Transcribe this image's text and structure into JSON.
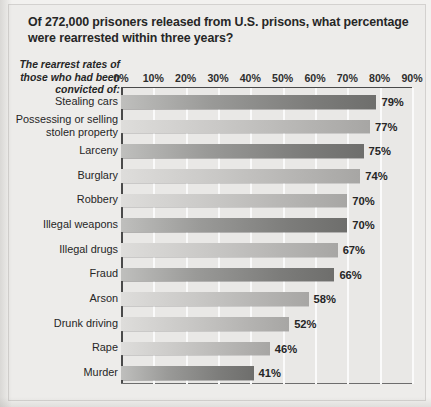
{
  "title": "Of 272,000 prisoners released from U.S. prisons, what percentage were rearrested within three years?",
  "axis_caption": "The rearrest rates of those who had been convicted of:",
  "colors": {
    "paper": "#edecea",
    "plot_background": "#e9e8e6",
    "gridline": "#fafafa",
    "axis": "#4a4a4a",
    "bar_dark": "#7c7c7a",
    "bar_light": "#b2b1af",
    "text": "#262626"
  },
  "chart_data": {
    "type": "bar",
    "orientation": "horizontal",
    "title": "Of 272,000 prisoners released from U.S. prisons, what percentage were rearrested within three years?",
    "xlabel": "",
    "ylabel": "The rearrest rates of those who had been convicted of:",
    "xlim": [
      0,
      90
    ],
    "xtick_labels": [
      "0%",
      "10%",
      "20%",
      "30%",
      "40%",
      "50%",
      "60%",
      "70%",
      "80%",
      "90%"
    ],
    "xticks": [
      0,
      10,
      20,
      30,
      40,
      50,
      60,
      70,
      80,
      90
    ],
    "grid": "vertical",
    "legend": "none",
    "value_suffix": "%",
    "categories": [
      "Stealing cars",
      "Possessing or selling stolen property",
      "Larceny",
      "Burglary",
      "Robbery",
      "Illegal weapons",
      "Illegal drugs",
      "Fraud",
      "Arson",
      "Drunk driving",
      "Rape",
      "Murder"
    ],
    "values": [
      79,
      77,
      75,
      74,
      70,
      70,
      67,
      66,
      58,
      52,
      46,
      41
    ],
    "data_labels": [
      "79%",
      "77%",
      "75%",
      "74%",
      "70%",
      "70%",
      "67%",
      "66%",
      "58%",
      "52%",
      "46%",
      "41%"
    ],
    "bar_shades": [
      "dark",
      "light",
      "dark",
      "light",
      "light",
      "dark",
      "light",
      "dark",
      "light",
      "light",
      "light",
      "dark"
    ],
    "category_label_lines": [
      [
        "Stealing cars"
      ],
      [
        "Possessing or selling",
        "stolen property"
      ],
      [
        "Larceny"
      ],
      [
        "Burglary"
      ],
      [
        "Robbery"
      ],
      [
        "Illegal weapons"
      ],
      [
        "Illegal drugs"
      ],
      [
        "Fraud"
      ],
      [
        "Arson"
      ],
      [
        "Drunk driving"
      ],
      [
        "Rape"
      ],
      [
        "Murder"
      ]
    ]
  }
}
